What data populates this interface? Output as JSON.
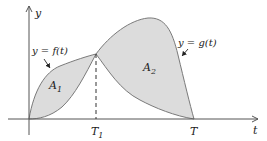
{
  "axes": {
    "x_label": "t",
    "y_label": "y"
  },
  "curves": {
    "f_label": "y = f(t)",
    "g_label": "y = g(t)"
  },
  "regions": {
    "a1_main": "A",
    "a1_sub": "1",
    "a2_main": "A",
    "a2_sub": "2"
  },
  "ticks": {
    "t1_main": "T",
    "t1_sub": "1",
    "t_end": "T"
  },
  "colors": {
    "fill": "#dcdcdc",
    "curve": "#7a7a7a",
    "axis": "#555555"
  }
}
